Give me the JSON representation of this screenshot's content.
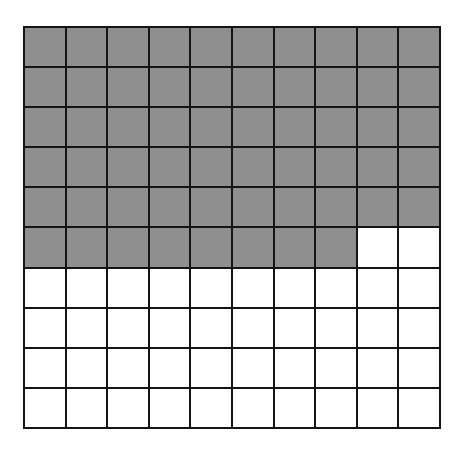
{
  "diagram": {
    "type": "hundred-grid",
    "rows": 10,
    "columns": 10,
    "shaded_count": 58,
    "total": 100,
    "shaded_color": "#8f8f8f",
    "unshaded_color": "#ffffff",
    "line_color": "#151515"
  }
}
